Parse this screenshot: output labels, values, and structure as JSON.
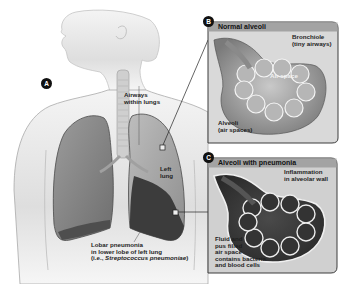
{
  "figure": {
    "markers": {
      "a": "A",
      "b": "B",
      "c": "C"
    },
    "main_labels": {
      "airways_line1": "Airways",
      "airways_line2": "within lungs",
      "left_lung_line1": "Left",
      "left_lung_line2": "lung",
      "lobar_line1": "Lobar pneumonia",
      "lobar_line2": "in lower lobe of left lung",
      "lobar_line3_prefix": "(i.e., ",
      "lobar_line3_italic": "Streptococcus pneumoniae",
      "lobar_line3_suffix": ")"
    },
    "panel_b": {
      "title": "Normal alveoli",
      "bronchiole_line1": "Bronchiole",
      "bronchiole_line2": "(tiny airways)",
      "air_space": "Air space",
      "alveoli_line1": "Alveoli",
      "alveoli_line2": "(air spaces)"
    },
    "panel_c": {
      "title": "Alveoli with pneumonia",
      "inflammation_line1": "Inflammation",
      "inflammation_line2": "in alveolar wall",
      "fluid_line1": "Fluid and",
      "fluid_line2": "pus filled",
      "fluid_line3": "air space",
      "fluid_line4": "contains bacteria",
      "fluid_line5": "and blood cells"
    },
    "colors": {
      "panel_header": "#9a9a9a",
      "panel_border": "#3c3c3c",
      "lung_normal": "#8a8a8a",
      "lung_infected": "#3e3e3e",
      "skin": "#e6e6e6"
    }
  }
}
